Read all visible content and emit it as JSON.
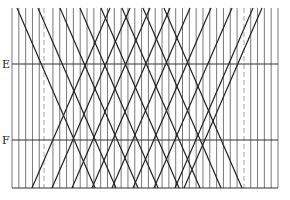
{
  "diagram": {
    "labels": [
      {
        "text": "E",
        "y": 64
      },
      {
        "text": "F",
        "y": 140
      }
    ],
    "frame": {
      "left": 12,
      "right": 278,
      "top": 8,
      "bottom": 188
    },
    "vertical_lines": {
      "start": 12,
      "end": 278,
      "count": 40
    },
    "dashed_lines_x": [
      44,
      244
    ],
    "horizontal_lines_y": [
      64,
      140,
      188
    ],
    "diagonal_run": 78,
    "descending_start_x": [
      17,
      38,
      60,
      80,
      101,
      122,
      143,
      164
    ],
    "ascending_start_x": [
      32,
      52,
      72,
      92,
      112,
      133,
      154,
      175,
      184
    ],
    "colors": {
      "vertical": "#6a6a6a",
      "dashed": "#b5b5b5",
      "horizontal": "#333333",
      "diagonal": "#222222"
    }
  }
}
